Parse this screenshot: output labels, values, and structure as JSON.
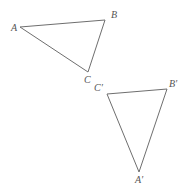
{
  "figure": {
    "name": "triangle-transformation-diagram",
    "background_color": "#ffffff",
    "stroke_color": "#6e6e6e",
    "label_color": "#545454",
    "stroke_width": 1,
    "width": 186,
    "height": 191,
    "shapes": [
      {
        "id": "triangle-abc",
        "name": "triangle-abc",
        "type": "triangle",
        "points": "20,27 105,20 88,72",
        "vertices": [
          {
            "label": "A",
            "x": 20,
            "y": 27
          },
          {
            "label": "B",
            "x": 105,
            "y": 20
          },
          {
            "label": "C",
            "x": 88,
            "y": 72
          }
        ]
      },
      {
        "id": "triangle-abc-prime",
        "name": "triangle-abc-prime",
        "type": "triangle",
        "points": "107,94 167,89 139,172",
        "vertices": [
          {
            "label": "C′",
            "x": 107,
            "y": 94
          },
          {
            "label": "B′",
            "x": 167,
            "y": 89
          },
          {
            "label": "A′",
            "x": 139,
            "y": 172
          }
        ]
      }
    ],
    "labels": [
      {
        "id": "label-a",
        "text": "A",
        "x": 11,
        "y": 23
      },
      {
        "id": "label-b",
        "text": "B",
        "x": 111,
        "y": 10
      },
      {
        "id": "label-c",
        "text": "C",
        "x": 84,
        "y": 75
      },
      {
        "id": "label-c-prime",
        "text": "C′",
        "x": 94,
        "y": 83
      },
      {
        "id": "label-b-prime",
        "text": "B′",
        "x": 169,
        "y": 79
      },
      {
        "id": "label-a-prime",
        "text": "A′",
        "x": 135,
        "y": 175
      }
    ]
  }
}
